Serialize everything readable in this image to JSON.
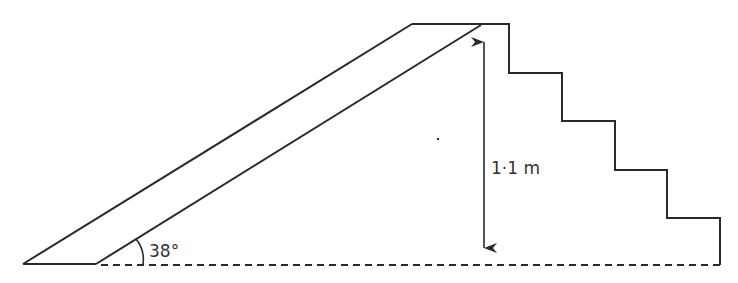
{
  "diagram": {
    "type": "ramp-and-steps",
    "angle_label": "38°",
    "height_label": "1·1 m",
    "colors": {
      "stroke": "#2a2a2a",
      "background": "#ffffff",
      "text": "#333333"
    },
    "steps_count": 4
  }
}
